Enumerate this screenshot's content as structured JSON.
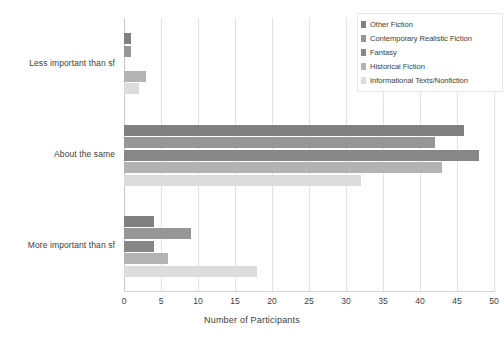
{
  "chart_data": {
    "type": "bar",
    "orientation": "horizontal",
    "grouped": true,
    "title": "",
    "xlabel": "Number of Participants",
    "ylabel": "",
    "xlim": [
      0,
      50
    ],
    "xticks": [
      0,
      5,
      10,
      15,
      20,
      25,
      30,
      35,
      40,
      45,
      50
    ],
    "grid": true,
    "grid_axis": "x",
    "legend_position": "top-right",
    "categories": [
      "Less important than sf",
      "About the same",
      "More important than sf"
    ],
    "series": [
      {
        "name": "Other Fiction",
        "color": "#808080",
        "values": [
          1,
          46,
          4
        ]
      },
      {
        "name": "Contemporary Realistic Fiction",
        "color": "#969696",
        "values": [
          1,
          42,
          9
        ]
      },
      {
        "name": "Fantasy",
        "color": "#878787",
        "values": [
          0,
          48,
          4
        ]
      },
      {
        "name": "Historical Fiction",
        "color": "#b3b3b3",
        "values": [
          3,
          43,
          6
        ]
      },
      {
        "name": "Informational Texts/Nonfiction",
        "color": "#dcdcdc",
        "values": [
          2,
          32,
          18
        ]
      }
    ]
  },
  "axis": {
    "x_title": "Number of Participants",
    "tick_labels": [
      "0",
      "5",
      "10",
      "15",
      "20",
      "25",
      "30",
      "35",
      "40",
      "45",
      "50"
    ]
  },
  "legend": {
    "items": [
      {
        "label": "Other Fiction",
        "color": "#808080"
      },
      {
        "label": "Contemporary Realistic Fiction",
        "color": "#969696"
      },
      {
        "label": "Fantasy",
        "color": "#878787"
      },
      {
        "label": "Historical Fiction",
        "color": "#b3b3b3"
      },
      {
        "label": "Informational Texts/Nonfiction",
        "color": "#dcdcdc"
      }
    ]
  }
}
